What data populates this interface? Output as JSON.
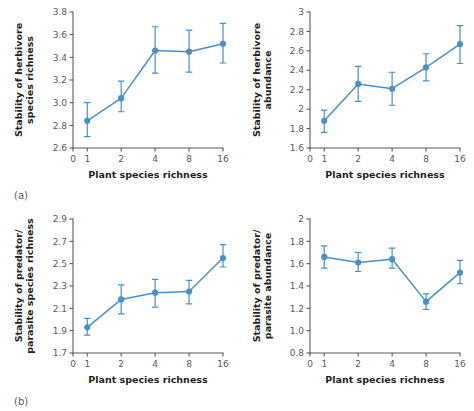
{
  "figure": {
    "background": "#ffffff",
    "accent_color": "#4a90c8",
    "axis_color": "#58595b",
    "text_color": "#231f20"
  },
  "panel_labels": {
    "a": "(a)",
    "b": "(b)"
  },
  "chart_data": [
    {
      "id": "herbivore-species-richness",
      "panel_label": "(a)",
      "position": "top-left",
      "type": "line",
      "title": "",
      "xlabel": "Plant species richness",
      "ylabel": "Stability of herbivore species richness",
      "ylabel_lines": [
        "Stability of herbivore",
        "species richness"
      ],
      "x_scale": "log2-with-zero",
      "x_ticks": [
        0,
        1,
        2,
        4,
        8,
        16
      ],
      "x_ticklabels": [
        "0",
        "1",
        "2",
        "4",
        "8",
        "16"
      ],
      "y_ticks": [
        2.6,
        2.8,
        3.0,
        3.2,
        3.4,
        3.6,
        3.8
      ],
      "y_ticklabels": [
        "2.6",
        "2.8",
        "3.0",
        "3.2",
        "3.4",
        "3.6",
        "3.8"
      ],
      "ylim": [
        2.6,
        3.8
      ],
      "grid": false,
      "legend": "none",
      "series": [
        {
          "name": "Stability of herbivore species richness",
          "color": "#4a90c8",
          "x": [
            1,
            2,
            4,
            8,
            16
          ],
          "values": [
            2.84,
            3.04,
            3.46,
            3.45,
            3.52
          ],
          "error_low": [
            2.7,
            2.92,
            3.26,
            3.27,
            3.35
          ],
          "error_high": [
            3.0,
            3.19,
            3.67,
            3.64,
            3.7
          ]
        }
      ]
    },
    {
      "id": "herbivore-abundance",
      "panel_label": "",
      "position": "top-right",
      "type": "line",
      "title": "",
      "xlabel": "Plant species richness",
      "ylabel": "Stability of herbivore abundance",
      "ylabel_lines": [
        "Stability of herbivore",
        "abundance"
      ],
      "x_scale": "log2-with-zero",
      "x_ticks": [
        0,
        1,
        2,
        4,
        8,
        16
      ],
      "x_ticklabels": [
        "0",
        "1",
        "2",
        "4",
        "8",
        "16"
      ],
      "y_ticks": [
        1.6,
        1.8,
        2.0,
        2.2,
        2.4,
        2.6,
        2.8,
        3.0
      ],
      "y_ticklabels": [
        "1.6",
        "1.8",
        "2",
        "2.2",
        "2.4",
        "2.6",
        "2.8",
        "3"
      ],
      "ylim": [
        1.6,
        3.0
      ],
      "grid": false,
      "legend": "none",
      "series": [
        {
          "name": "Stability of herbivore abundance",
          "color": "#4a90c8",
          "x": [
            1,
            2,
            4,
            8,
            16
          ],
          "values": [
            1.88,
            2.26,
            2.21,
            2.43,
            2.67
          ],
          "error_low": [
            1.76,
            2.08,
            2.04,
            2.29,
            2.47
          ],
          "error_high": [
            1.99,
            2.44,
            2.38,
            2.57,
            2.86
          ]
        }
      ]
    },
    {
      "id": "predator-parasite-species-richness",
      "panel_label": "(b)",
      "position": "bottom-left",
      "type": "line",
      "title": "",
      "xlabel": "Plant species richness",
      "ylabel": "Stability of predator/parasite species richness",
      "ylabel_lines": [
        "Stability of predator/",
        "parasite species richness"
      ],
      "x_scale": "log2-with-zero",
      "x_ticks": [
        0,
        1,
        2,
        4,
        8,
        16
      ],
      "x_ticklabels": [
        "0",
        "1",
        "2",
        "4",
        "8",
        "16"
      ],
      "y_ticks": [
        1.7,
        1.9,
        2.1,
        2.3,
        2.5,
        2.7,
        2.9
      ],
      "y_ticklabels": [
        "1.7",
        "1.9",
        "2.1",
        "2.3",
        "2.5",
        "2.7",
        "2.9"
      ],
      "ylim": [
        1.7,
        2.9
      ],
      "grid": false,
      "legend": "none",
      "series": [
        {
          "name": "Stability of predator/parasite species richness",
          "color": "#4a90c8",
          "x": [
            1,
            2,
            4,
            8,
            16
          ],
          "values": [
            1.93,
            2.18,
            2.24,
            2.25,
            2.55
          ],
          "error_low": [
            1.86,
            2.05,
            2.11,
            2.14,
            2.47
          ],
          "error_high": [
            2.01,
            2.31,
            2.36,
            2.35,
            2.67
          ]
        }
      ]
    },
    {
      "id": "predator-parasite-abundance",
      "panel_label": "",
      "position": "bottom-right",
      "type": "line",
      "title": "",
      "xlabel": "Plant species richness",
      "ylabel": "Stability of predator/parasite abundance",
      "ylabel_lines": [
        "Stability of predator/",
        "parasite abundance"
      ],
      "x_scale": "log2-with-zero",
      "x_ticks": [
        0,
        1,
        2,
        4,
        8,
        16
      ],
      "x_ticklabels": [
        "0",
        "1",
        "2",
        "4",
        "8",
        "16"
      ],
      "y_ticks": [
        0.8,
        1.0,
        1.2,
        1.4,
        1.6,
        1.8,
        2.0
      ],
      "y_ticklabels": [
        "0.8",
        "1.0",
        "1.2",
        "1.4",
        "1.6",
        "1.8",
        "2"
      ],
      "ylim": [
        0.8,
        2.0
      ],
      "grid": false,
      "legend": "none",
      "series": [
        {
          "name": "Stability of predator/parasite abundance",
          "color": "#4a90c8",
          "x": [
            1,
            2,
            4,
            8,
            16
          ],
          "values": [
            1.66,
            1.61,
            1.64,
            1.26,
            1.52
          ],
          "error_low": [
            1.56,
            1.53,
            1.56,
            1.19,
            1.42
          ],
          "error_high": [
            1.76,
            1.7,
            1.74,
            1.33,
            1.63
          ]
        }
      ]
    }
  ]
}
